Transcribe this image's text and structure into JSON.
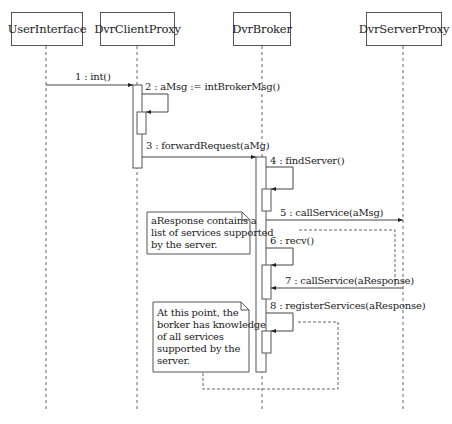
{
  "diagram": {
    "type": "UML sequence diagram",
    "participants": [
      {
        "name": "UserInterface"
      },
      {
        "name": "DvrClientProxy"
      },
      {
        "name": "DvrBroker"
      },
      {
        "name": "DvrServerProxy"
      }
    ],
    "messages": [
      {
        "label": "1 : int()",
        "from": "UserInterface",
        "to": "DvrClientProxy"
      },
      {
        "label": "2 : aMsg := intBrokerMsg()",
        "from": "DvrClientProxy",
        "to": "DvrClientProxy"
      },
      {
        "label": "3 : forwardRequest(aMg)",
        "from": "DvrClientProxy",
        "to": "DvrBroker"
      },
      {
        "label": "4 : findServer()",
        "from": "DvrBroker",
        "to": "DvrBroker"
      },
      {
        "label": "5 : callService(aMsg)",
        "from": "DvrBroker",
        "to": "DvrServerProxy"
      },
      {
        "label": "6 : recv()",
        "from": "DvrBroker",
        "to": "DvrBroker"
      },
      {
        "label": "7 : callService(aResponse)",
        "from": "DvrServerProxy",
        "to": "DvrBroker"
      },
      {
        "label": "8 : registerServices(aResponse)",
        "from": "DvrBroker",
        "to": "DvrBroker"
      }
    ],
    "notes": [
      {
        "lines": [
          "aResponse contains a",
          "list of services supported",
          "by the server."
        ]
      },
      {
        "lines": [
          "At this point, the",
          "borker has knowledge",
          "of all services",
          "supported by the",
          "server."
        ]
      }
    ]
  }
}
